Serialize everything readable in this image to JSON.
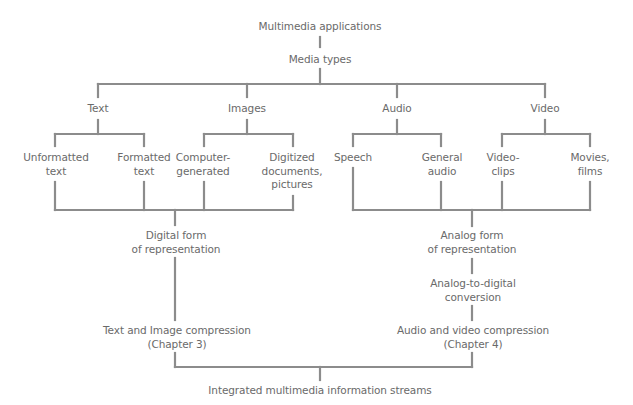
{
  "diagram": {
    "line_color": "#8c8c8c",
    "text_color": "#6a6a6a",
    "root": "Multimedia applications",
    "media_types": "Media types",
    "categories": [
      {
        "label": "Text",
        "children": [
          [
            "Unformatted",
            "text"
          ],
          [
            "Formatted",
            "text"
          ]
        ]
      },
      {
        "label": "Images",
        "children": [
          [
            "Computer-",
            "generated"
          ],
          [
            "Digitized",
            "documents,",
            "pictures"
          ]
        ]
      },
      {
        "label": "Audio",
        "children": [
          [
            "Speech"
          ],
          [
            "General",
            "audio"
          ]
        ]
      },
      {
        "label": "Video",
        "children": [
          [
            "Video-",
            "clips"
          ],
          [
            "Movies,",
            "films"
          ]
        ]
      }
    ],
    "digital": {
      "form": [
        "Digital form",
        "of representation"
      ],
      "compression": [
        "Text and Image compression",
        "(Chapter 3)"
      ]
    },
    "analog": {
      "form": [
        "Analog form",
        "of representation"
      ],
      "conversion": [
        "Analog-to-digital",
        "conversion"
      ],
      "compression": [
        "Audio and video compression",
        "(Chapter 4)"
      ]
    },
    "output": "Integrated multimedia information streams"
  }
}
